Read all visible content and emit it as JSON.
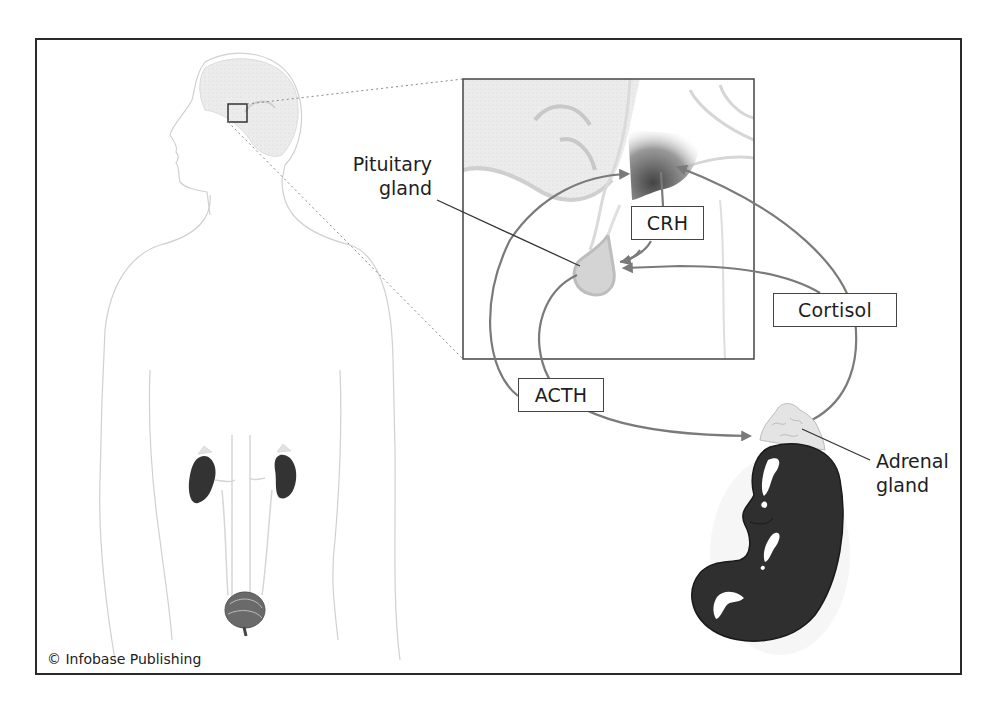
{
  "diagram": {
    "type": "hormone-feedback-loop",
    "labels": {
      "pituitary": [
        "Pituitary",
        "gland"
      ],
      "crh": "CRH",
      "cortisol": "Cortisol",
      "acth": "ACTH",
      "adrenal": [
        "Adrenal",
        "gland"
      ]
    },
    "copyright": "© Infobase Publishing",
    "flows": [
      {
        "from": "Hypothalamus",
        "to": "Pituitary gland",
        "hormone": "CRH"
      },
      {
        "from": "Pituitary gland",
        "to": "Adrenal gland",
        "hormone": "ACTH"
      },
      {
        "from": "Adrenal gland",
        "to": "Hypothalamus",
        "hormone": "Cortisol"
      },
      {
        "from": "Adrenal gland",
        "to": "Pituitary gland",
        "hormone": "Cortisol"
      },
      {
        "from": "Pituitary gland",
        "to": "Hypothalamus",
        "hormone": "ACTH"
      }
    ],
    "colors": {
      "frame": "#2a2a2a",
      "arrow": "#7a7a7a",
      "kidney": "#2e2e2e",
      "tissue": "#e6e6e6",
      "outline": "#cfcfcf"
    }
  }
}
